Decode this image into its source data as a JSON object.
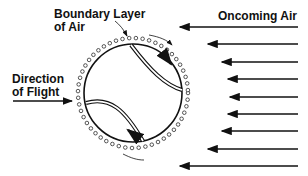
{
  "labels": {
    "boundary_line1": "Boundary Layer",
    "boundary_line2": "of Air",
    "oncoming": "Oncoming Air",
    "direction_line1": "Direction",
    "direction_line2": "of Flight"
  },
  "ball": {
    "cx": 133,
    "cy": 93,
    "r": 49
  },
  "air_arrows": [
    {
      "y": 27,
      "x_start": 298,
      "x_end": 174
    },
    {
      "y": 44,
      "x_start": 298,
      "x_end": 202
    },
    {
      "y": 62,
      "x_start": 298,
      "x_end": 216
    },
    {
      "y": 79,
      "x_start": 298,
      "x_end": 222
    },
    {
      "y": 97,
      "x_start": 298,
      "x_end": 224
    },
    {
      "y": 114,
      "x_start": 298,
      "x_end": 222
    },
    {
      "y": 131,
      "x_start": 298,
      "x_end": 216
    },
    {
      "y": 149,
      "x_start": 298,
      "x_end": 202
    },
    {
      "y": 166,
      "x_start": 298,
      "x_end": 174
    }
  ],
  "colors": {
    "ink": "#111111",
    "background": "#ffffff"
  }
}
